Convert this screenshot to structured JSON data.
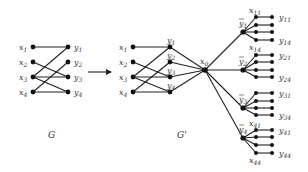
{
  "colors": {
    "ink": "#222222",
    "node": "#111111",
    "label": "#333333",
    "background": "#ffffff"
  },
  "graphs": {
    "G": {
      "caption": "G",
      "caption_pos": [
        48,
        138
      ],
      "left_nodes": [
        {
          "id": "x1",
          "base": "x",
          "sub": "1",
          "pos": [
            33,
            47
          ]
        },
        {
          "id": "x2",
          "base": "x",
          "sub": "2",
          "pos": [
            33,
            62
          ]
        },
        {
          "id": "x3",
          "base": "x",
          "sub": "3",
          "pos": [
            33,
            77
          ]
        },
        {
          "id": "x4",
          "base": "x",
          "sub": "4",
          "pos": [
            33,
            92
          ]
        }
      ],
      "right_nodes": [
        {
          "id": "y1",
          "base": "y",
          "sub": "1",
          "pos": [
            68,
            47
          ]
        },
        {
          "id": "y2",
          "base": "y",
          "sub": "2",
          "pos": [
            68,
            62
          ]
        },
        {
          "id": "y3",
          "base": "y",
          "sub": "3",
          "pos": [
            68,
            77
          ]
        },
        {
          "id": "y4",
          "base": "y",
          "sub": "4",
          "pos": [
            68,
            92
          ]
        }
      ],
      "edges": [
        [
          "x1",
          "y1"
        ],
        [
          "x2",
          "y3"
        ],
        [
          "x3",
          "y1"
        ],
        [
          "x3",
          "y3"
        ],
        [
          "x3",
          "y4"
        ],
        [
          "x4",
          "y2"
        ],
        [
          "x4",
          "y4"
        ]
      ]
    },
    "arrow": {
      "from": [
        88,
        72
      ],
      "to": [
        111,
        72
      ]
    },
    "G_prime": {
      "caption": "G'",
      "caption_pos": [
        177,
        138
      ],
      "left_nodes": [
        {
          "id": "x1",
          "base": "x",
          "sub": "1",
          "pos": [
            133,
            47
          ]
        },
        {
          "id": "x2",
          "base": "x",
          "sub": "2",
          "pos": [
            133,
            62
          ]
        },
        {
          "id": "x3",
          "base": "x",
          "sub": "3",
          "pos": [
            133,
            77
          ]
        },
        {
          "id": "x4",
          "base": "x",
          "sub": "4",
          "pos": [
            133,
            92
          ]
        }
      ],
      "right_nodes": [
        {
          "id": "y1",
          "base": "y",
          "sub": "1",
          "pos": [
            170,
            47
          ]
        },
        {
          "id": "y2",
          "base": "y",
          "sub": "2",
          "pos": [
            170,
            62
          ]
        },
        {
          "id": "y3",
          "base": "y",
          "sub": "3",
          "pos": [
            170,
            77
          ]
        },
        {
          "id": "y4",
          "base": "y",
          "sub": "4",
          "pos": [
            170,
            92
          ]
        }
      ],
      "edges": [
        [
          "x1",
          "y1"
        ],
        [
          "x2",
          "y3"
        ],
        [
          "x3",
          "y1"
        ],
        [
          "x3",
          "y3"
        ],
        [
          "x3",
          "y4"
        ],
        [
          "x4",
          "y2"
        ],
        [
          "x4",
          "y4"
        ]
      ],
      "hub": {
        "id": "x0",
        "base": "x",
        "sub": "0",
        "pos": [
          205,
          70
        ]
      },
      "groups": [
        {
          "hub_label": "ȳ",
          "sub": "1",
          "pos": [
            243,
            32
          ],
          "rows": [
            17,
            25,
            32,
            40
          ],
          "top_label": "x11",
          "bottom_label": "x14",
          "y_top": "y11",
          "y_bottom": "y14"
        },
        {
          "hub_label": "ȳ",
          "sub": "2",
          "pos": [
            243,
            70
          ],
          "rows": [
            55,
            62,
            70,
            77
          ],
          "top_label": "",
          "bottom_label": "",
          "y_top": "y21",
          "y_bottom": "y24"
        },
        {
          "hub_label": "ȳ",
          "sub": "3",
          "pos": [
            243,
            108
          ],
          "rows": [
            93,
            101,
            108,
            115
          ],
          "top_label": "",
          "bottom_label": "",
          "y_top": "y31",
          "y_bottom": "y34"
        },
        {
          "hub_label": "ȳ",
          "sub": "4",
          "pos": [
            243,
            138
          ],
          "rows": [
            130,
            137,
            145,
            153
          ],
          "top_label": "x41",
          "bottom_label": "x44",
          "y_top": "y41",
          "y_bottom": "y44"
        }
      ],
      "leaf_x_col": 256,
      "leaf_y_col": 272
    }
  }
}
